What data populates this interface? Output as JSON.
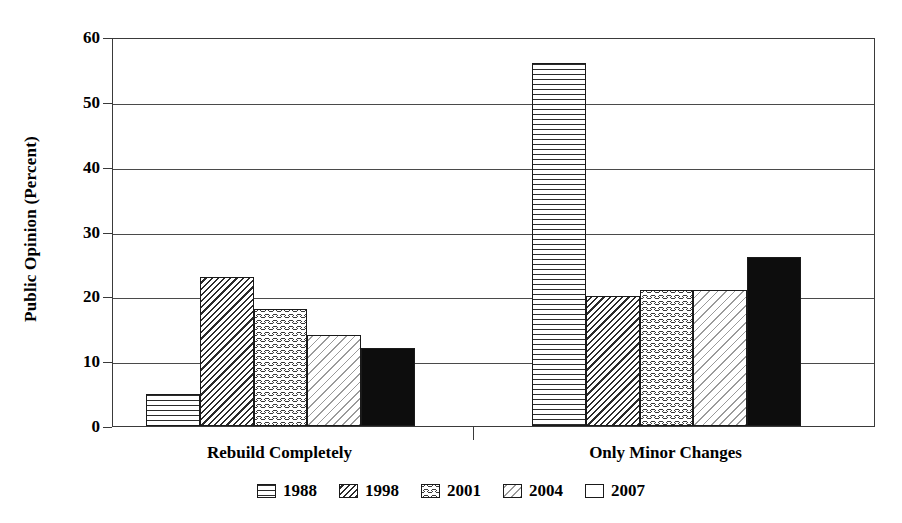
{
  "chart_data": {
    "type": "bar",
    "title": "",
    "xlabel": "",
    "ylabel": "Public Opinion (Percent)",
    "ylim": [
      0,
      60
    ],
    "ytick_values": [
      60,
      50,
      40,
      30,
      20,
      10,
      0
    ],
    "ytick_labels": [
      "60",
      "50",
      "40",
      "30",
      "20",
      "10",
      "0"
    ],
    "grid": "horizontal",
    "legend_position": "bottom-center",
    "categories": [
      "Rebuild Completely",
      "Only Minor Changes"
    ],
    "series": [
      {
        "name": "1988",
        "pattern": "horizontal-lines",
        "values": [
          5,
          56
        ]
      },
      {
        "name": "1998",
        "pattern": "diagonal-hatch",
        "values": [
          23,
          20
        ]
      },
      {
        "name": "2001",
        "pattern": "wavy-lines",
        "values": [
          18,
          21
        ]
      },
      {
        "name": "2004",
        "pattern": "light-diagonal",
        "values": [
          14,
          21
        ]
      },
      {
        "name": "2007",
        "pattern": "solid-black",
        "values": [
          12,
          26
        ]
      }
    ]
  },
  "colors": {
    "background": "#ffffff",
    "ink": "#000000",
    "axis": "#3a3a3a",
    "gridline": "#4a4a4a",
    "bar_outline": "#1a1a1a",
    "solid_fill": "#0d0d0d"
  }
}
